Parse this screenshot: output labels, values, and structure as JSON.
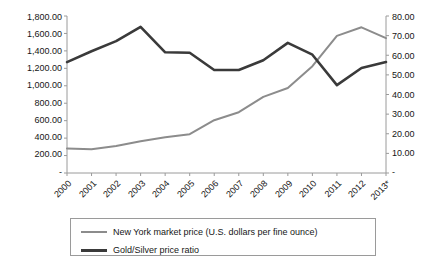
{
  "chart_data": {
    "type": "line",
    "title": "",
    "subtitle": "",
    "xlabel": "",
    "ylabel": "",
    "grid": false,
    "legend_position": "bottom",
    "x": [
      "2000",
      "2001",
      "2002",
      "2003",
      "2004",
      "2005",
      "2006",
      "2007",
      "2008",
      "2009",
      "2010",
      "2011",
      "2012",
      "2013*"
    ],
    "categories": [
      "2000",
      "2001",
      "2002",
      "2003",
      "2004",
      "2005",
      "2006",
      "2007",
      "2008",
      "2009",
      "2010",
      "2011",
      "2012",
      "2013*"
    ],
    "axes": {
      "left": {
        "ticks": [
          "1,800.00",
          "1,600.00",
          "1,400.00",
          "1,200.00",
          "1,000.00",
          "800.00",
          "600.00",
          "400.00",
          "200.00",
          "-"
        ],
        "tick_values": [
          1800,
          1600,
          1400,
          1200,
          1000,
          800,
          600,
          400,
          200,
          0
        ],
        "ylim": [
          0,
          1800
        ]
      },
      "right": {
        "ticks": [
          "80.00",
          "70.00",
          "60.00",
          "50.00",
          "40.00",
          "30.00",
          "20.00",
          "10.00",
          "-"
        ],
        "tick_values": [
          80,
          70,
          60,
          50,
          40,
          30,
          20,
          10,
          0
        ],
        "ylim": [
          0,
          80
        ]
      }
    },
    "series": [
      {
        "name": "New York market price (U.S. dollars per fine ounce)",
        "axis": "left",
        "color": "#8c8c8c",
        "values": [
          280,
          272,
          310,
          365,
          410,
          445,
          605,
          697,
          872,
          974,
          1225,
          1572,
          1670,
          1545
        ]
      },
      {
        "name": "Gold/Silver price ratio",
        "axis": "right",
        "color": "#3a3a3a",
        "values": [
          56.5,
          62.0,
          67.2,
          74.5,
          61.5,
          61.3,
          52.5,
          52.5,
          57.5,
          66.3,
          60.3,
          44.8,
          53.5,
          56.5
        ]
      }
    ]
  },
  "legend": {
    "items": [
      {
        "label": "New York market price (U.S. dollars per fine ounce)",
        "color": "#8c8c8c"
      },
      {
        "label": "Gold/Silver price ratio",
        "color": "#3a3a3a"
      }
    ]
  }
}
